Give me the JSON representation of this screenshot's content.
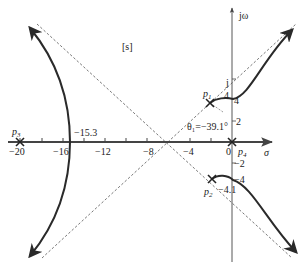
{
  "diagram": {
    "type": "root-locus",
    "plane_label": "[s]",
    "axes": {
      "real_label": "σ",
      "imag_label": "jω",
      "real_ticks": [
        {
          "value": -20,
          "label": "−20"
        },
        {
          "value": -16,
          "label": "−16"
        },
        {
          "value": -12,
          "label": "−12"
        },
        {
          "value": -8,
          "label": "−8"
        },
        {
          "value": -4,
          "label": "−4"
        },
        {
          "value": 0,
          "label": "0"
        }
      ],
      "imag_ticks": [
        {
          "value": 4,
          "label": "4"
        },
        {
          "value": 2,
          "label": "2"
        },
        {
          "value": -2,
          "label": "−2"
        },
        {
          "value": -4,
          "label": "−4"
        }
      ],
      "imag_marker_label": "j"
    },
    "poles": [
      {
        "name": "p1",
        "label": "p",
        "sub": "1"
      },
      {
        "name": "p2",
        "label": "p",
        "sub": "2"
      },
      {
        "name": "p3",
        "label": "p",
        "sub": "3"
      },
      {
        "name": "p4",
        "label": "p",
        "sub": "4"
      }
    ],
    "annotations": {
      "breakaway": "−15.3",
      "departure_angle": "θ₁=−39.1°",
      "crossing_upper": "4.1",
      "crossing_lower": "−4.1",
      "crossing_upper_pre": "4"
    },
    "colors": {
      "locus": "#2a2a2a",
      "axis": "#444444",
      "asymptote": "#555555",
      "text": "#222222"
    }
  }
}
